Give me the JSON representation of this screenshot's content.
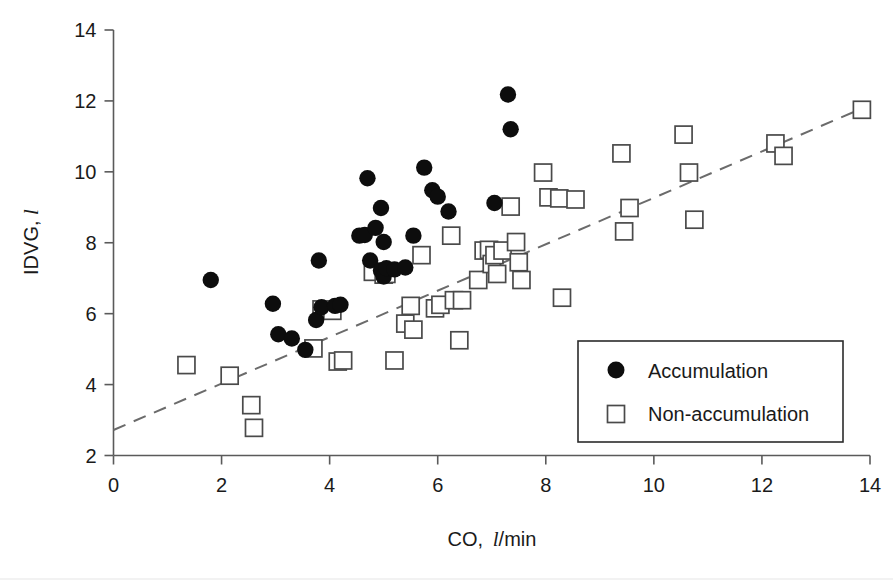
{
  "chart_data": {
    "type": "scatter",
    "title": "",
    "xlabel": "CO,  l/min",
    "xlabel_prefix": "CO,",
    "xlabel_unit_italic": "l",
    "xlabel_unit_rest": "/min",
    "ylabel": "IDVG, l",
    "ylabel_prefix": "IDVG,",
    "ylabel_unit_italic": "l",
    "xlim": [
      0,
      14
    ],
    "ylim": [
      2,
      14
    ],
    "xticks": [
      0,
      2,
      4,
      6,
      8,
      10,
      12,
      14
    ],
    "yticks": [
      2,
      4,
      6,
      8,
      10,
      12,
      14
    ],
    "xtick_labels": [
      "0",
      "2",
      "4",
      "6",
      "8",
      "10",
      "12",
      "14"
    ],
    "ytick_labels": [
      "2",
      "4",
      "6",
      "8",
      "10",
      "12",
      "14"
    ],
    "grid": false,
    "legend_position": "lower-right",
    "series": [
      {
        "name": "Accumulation",
        "marker": "filled-circle",
        "color": "#0d0d0d",
        "points": [
          [
            1.8,
            6.95
          ],
          [
            2.95,
            6.28
          ],
          [
            3.05,
            5.42
          ],
          [
            3.3,
            5.3
          ],
          [
            3.55,
            4.98
          ],
          [
            3.75,
            5.82
          ],
          [
            3.8,
            7.5
          ],
          [
            3.85,
            6.18
          ],
          [
            4.1,
            6.22
          ],
          [
            4.2,
            6.25
          ],
          [
            4.55,
            8.2
          ],
          [
            4.65,
            8.22
          ],
          [
            4.7,
            9.82
          ],
          [
            4.75,
            7.5
          ],
          [
            4.85,
            8.42
          ],
          [
            4.95,
            8.98
          ],
          [
            4.95,
            7.22
          ],
          [
            5.0,
            8.02
          ],
          [
            5.0,
            7.05
          ],
          [
            5.05,
            7.28
          ],
          [
            5.2,
            7.25
          ],
          [
            5.4,
            7.3
          ],
          [
            5.55,
            8.2
          ],
          [
            5.75,
            10.12
          ],
          [
            5.9,
            9.48
          ],
          [
            6.0,
            9.3
          ],
          [
            6.2,
            8.88
          ],
          [
            7.05,
            9.12
          ],
          [
            7.3,
            12.18
          ],
          [
            7.35,
            11.2
          ]
        ]
      },
      {
        "name": "Non-accumulation",
        "marker": "open-square",
        "color": "#ffffff",
        "edge_color": "#4a4a4a",
        "points": [
          [
            1.35,
            4.55
          ],
          [
            2.15,
            4.25
          ],
          [
            2.55,
            3.42
          ],
          [
            2.6,
            2.78
          ],
          [
            3.7,
            5.02
          ],
          [
            3.85,
            6.12
          ],
          [
            4.05,
            6.08
          ],
          [
            4.15,
            4.65
          ],
          [
            4.25,
            4.68
          ],
          [
            4.8,
            7.18
          ],
          [
            5.0,
            7.1
          ],
          [
            5.05,
            7.12
          ],
          [
            5.2,
            4.68
          ],
          [
            5.4,
            5.72
          ],
          [
            5.5,
            6.22
          ],
          [
            5.55,
            5.55
          ],
          [
            5.7,
            7.65
          ],
          [
            5.95,
            6.15
          ],
          [
            6.05,
            6.25
          ],
          [
            6.25,
            8.2
          ],
          [
            6.3,
            6.38
          ],
          [
            6.4,
            5.25
          ],
          [
            6.45,
            6.38
          ],
          [
            6.75,
            6.95
          ],
          [
            6.85,
            7.78
          ],
          [
            6.95,
            7.8
          ],
          [
            7.0,
            7.4
          ],
          [
            7.05,
            7.65
          ],
          [
            7.1,
            7.12
          ],
          [
            7.2,
            7.78
          ],
          [
            7.35,
            9.02
          ],
          [
            7.45,
            8.02
          ],
          [
            7.5,
            7.45
          ],
          [
            7.55,
            6.95
          ],
          [
            7.95,
            9.98
          ],
          [
            8.05,
            9.28
          ],
          [
            8.25,
            9.25
          ],
          [
            8.3,
            6.45
          ],
          [
            8.55,
            9.22
          ],
          [
            9.4,
            10.52
          ],
          [
            9.45,
            8.32
          ],
          [
            9.55,
            8.98
          ],
          [
            10.55,
            11.05
          ],
          [
            10.65,
            9.98
          ],
          [
            10.75,
            8.65
          ],
          [
            12.25,
            10.8
          ],
          [
            12.4,
            10.45
          ],
          [
            13.85,
            11.75
          ]
        ]
      }
    ],
    "trendline": {
      "style": "dashed",
      "color": "#6b6b6b",
      "x0": 0.0,
      "y0": 2.72,
      "x1": 13.9,
      "y1": 11.82
    },
    "legend_entries": [
      {
        "label": "Accumulation",
        "marker": "filled-circle"
      },
      {
        "label": "Non-accumulation",
        "marker": "open-square"
      }
    ]
  }
}
